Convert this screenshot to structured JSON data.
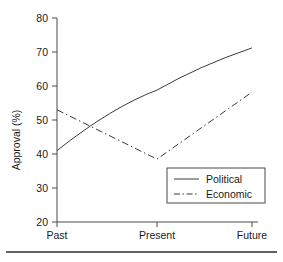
{
  "chart_data": {
    "type": "line",
    "title": "",
    "subtitle": "",
    "xlabel": "",
    "ylabel": "Approval (%)",
    "categories": [
      "Past",
      "Present",
      "Future"
    ],
    "x_tick_labels": [
      "Past",
      "Present",
      "Future"
    ],
    "y_tick_labels": [
      "20",
      "30",
      "40",
      "50",
      "60",
      "70",
      "80"
    ],
    "y_ticks": [
      20,
      30,
      40,
      50,
      60,
      70,
      80
    ],
    "ylim": [
      20,
      80
    ],
    "grid": false,
    "legend_position": "lower right",
    "series": [
      {
        "name": "Political",
        "values": [
          41,
          58.8,
          71.2
        ],
        "linestyle": "solid",
        "color": "#3a3a3a",
        "smooth": true
      },
      {
        "name": "Economic",
        "values": [
          53,
          38.5,
          58.2
        ],
        "linestyle": "dash-dot",
        "color": "#3a3a3a",
        "smooth": false
      }
    ],
    "legend_entries": [
      {
        "label": "Political",
        "linestyle": "solid"
      },
      {
        "label": "Economic",
        "linestyle": "dash-dot"
      }
    ]
  },
  "figure": {
    "footer_rule_visible": true
  }
}
